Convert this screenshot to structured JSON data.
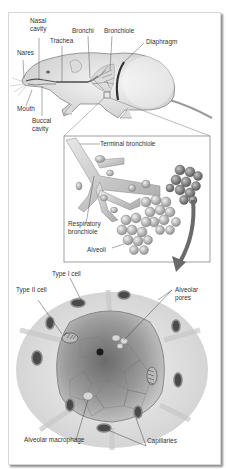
{
  "figure": {
    "panels": [
      {
        "id": "rodent-overview",
        "labels": [
          "Nasal cavity",
          "Bronchi",
          "Bronchiole",
          "Trachea",
          "Diaphragm",
          "Nares",
          "Mouth",
          "Buccal cavity"
        ]
      },
      {
        "id": "bronchiole-detail",
        "labels": [
          "Terminal bronchiole",
          "Respiratory bronchiole",
          "Alveoli"
        ]
      },
      {
        "id": "alveolus-cross-section",
        "labels": [
          "Type I cell",
          "Type II cell",
          "Alveolar pores",
          "Alveolar macrophage",
          "Capillaries"
        ]
      }
    ]
  },
  "labels": {
    "nasal_1": "Nasal",
    "nasal_2": "cavity",
    "bronchi": "Bronchi",
    "bronchiole": "Bronchiole",
    "trachea": "Trachea",
    "diaphragm": "Diaphragm",
    "nares": "Nares",
    "mouth": "Mouth",
    "buccal_1": "Buccal",
    "buccal_2": "cavity",
    "terminal_bronchiole": "Terminal bronchiole",
    "respiratory_1": "Respiratory",
    "respiratory_2": "bronchiole",
    "alveoli": "Alveoli",
    "type1": "Type I cell",
    "type2": "Type II cell",
    "pores_1": "Alveolar",
    "pores_2": "pores",
    "macrophage": "Alveolar macrophage",
    "capillaries": "Capillaries"
  },
  "colors": {
    "ink": "#333333",
    "body_fill": "#e6e6e6",
    "tissue_light": "#ececec",
    "tissue_mid": "#bdbdbd",
    "tissue_dark": "#555555",
    "arrow": "#6a6a6a"
  }
}
